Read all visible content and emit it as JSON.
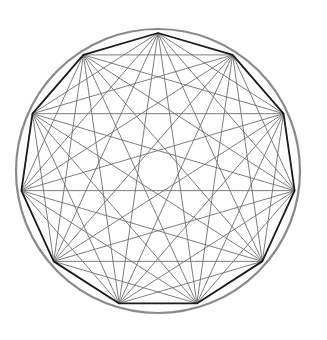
{
  "diagram": {
    "type": "complete-graph-polygon",
    "vertex_count": 11,
    "center": [
      158,
      171
    ],
    "circle_radius": 142,
    "polygon_radius": 138,
    "start_angle_deg": -90,
    "colors": {
      "background": "#ffffff",
      "circle": "#8a8a8a",
      "polygon_edge": "#1a1a1a",
      "diagonal": "#6e6e6e"
    },
    "stroke_widths": {
      "circle": 2.2,
      "polygon_edge": 1.8,
      "diagonal": 0.9
    }
  }
}
